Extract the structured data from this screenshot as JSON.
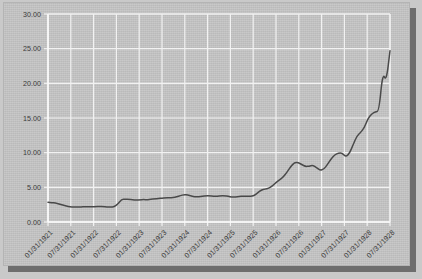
{
  "panel": {
    "background_color": "#c4c4c4",
    "shadow_color": "#6e6e6e",
    "grid_color": "#f2f2f2",
    "line_color": "#4a4a4a"
  },
  "chart_data": {
    "type": "line",
    "title": "",
    "subtitle": "",
    "xlabel": "",
    "ylabel": "",
    "ylim": [
      0.0,
      30.0
    ],
    "ytick_labels": [
      "0.00",
      "5.00",
      "10.00",
      "15.00",
      "20.00",
      "25.00",
      "30.00"
    ],
    "ytick_values": [
      0,
      5,
      10,
      15,
      20,
      25,
      30
    ],
    "grid": true,
    "legend": "none",
    "xtick_labels": [
      "01/31/1921",
      "07/31/1921",
      "01/31/1922",
      "07/31/1922",
      "01/31/1923",
      "07/31/1923",
      "01/31/1924",
      "07/31/1924",
      "01/31/1925",
      "07/31/1925",
      "01/31/1926",
      "07/31/1926",
      "01/31/1927",
      "07/31/1927",
      "01/31/1928",
      "07/31/1928"
    ],
    "xtick_rotation_degrees": -45,
    "series": [
      {
        "name": "index",
        "x": [
          "01/31/1921",
          "02/28/1921",
          "03/31/1921",
          "04/30/1921",
          "05/31/1921",
          "06/30/1921",
          "07/31/1921",
          "08/31/1921",
          "09/30/1921",
          "10/31/1921",
          "11/30/1921",
          "12/31/1921",
          "01/31/1922",
          "02/28/1922",
          "03/31/1922",
          "04/30/1922",
          "05/31/1922",
          "06/30/1922",
          "07/31/1922",
          "08/31/1922",
          "09/30/1922",
          "10/31/1922",
          "11/30/1922",
          "12/31/1922",
          "01/31/1923",
          "02/28/1923",
          "03/31/1923",
          "04/30/1923",
          "05/31/1923",
          "06/30/1923",
          "07/31/1923",
          "08/31/1923",
          "09/30/1923",
          "10/31/1923",
          "11/30/1923",
          "12/31/1923",
          "01/31/1924",
          "02/29/1924",
          "03/31/1924",
          "04/30/1924",
          "05/31/1924",
          "06/30/1924",
          "07/31/1924",
          "08/31/1924",
          "09/30/1924",
          "10/31/1924",
          "11/30/1924",
          "12/31/1924",
          "01/31/1925",
          "02/28/1925",
          "03/31/1925",
          "04/30/1925",
          "05/31/1925",
          "06/30/1925",
          "07/31/1925",
          "08/31/1925",
          "09/30/1925",
          "10/31/1925",
          "11/30/1925",
          "12/31/1925",
          "01/31/1926",
          "02/28/1926",
          "03/31/1926",
          "04/30/1926",
          "05/31/1926",
          "06/30/1926",
          "07/31/1926",
          "08/31/1926",
          "09/30/1926",
          "10/31/1926",
          "11/30/1926",
          "12/31/1926",
          "01/31/1927",
          "02/28/1927",
          "03/31/1927",
          "04/30/1927",
          "05/31/1927",
          "06/30/1927",
          "07/31/1927",
          "08/31/1927",
          "09/30/1927",
          "10/31/1927",
          "11/30/1927",
          "12/31/1927",
          "01/31/1928",
          "02/29/1928",
          "03/31/1928",
          "04/30/1928",
          "05/31/1928",
          "06/30/1928",
          "07/31/1928",
          "08/31/1928",
          "09/30/1928",
          "10/31/1928"
        ],
        "values": [
          2.85,
          2.8,
          2.72,
          2.6,
          2.45,
          2.3,
          2.18,
          2.15,
          2.15,
          2.18,
          2.22,
          2.2,
          2.2,
          2.22,
          2.25,
          2.22,
          2.18,
          2.15,
          2.2,
          2.6,
          3.25,
          3.3,
          3.28,
          3.22,
          3.15,
          3.2,
          3.25,
          3.2,
          3.3,
          3.35,
          3.38,
          3.45,
          3.48,
          3.5,
          3.52,
          3.62,
          3.8,
          3.95,
          3.9,
          3.72,
          3.62,
          3.65,
          3.7,
          3.78,
          3.78,
          3.72,
          3.7,
          3.8,
          3.8,
          3.72,
          3.58,
          3.6,
          3.68,
          3.72,
          3.72,
          3.7,
          3.78,
          4.2,
          4.62,
          4.75,
          4.85,
          5.2,
          5.7,
          6.1,
          6.5,
          7.2,
          8.0,
          8.55,
          8.58,
          8.3,
          8.0,
          8.05,
          8.2,
          7.85,
          7.45,
          7.6,
          8.3,
          9.1,
          9.7,
          9.95,
          9.95,
          9.4,
          9.9,
          11.2,
          12.4,
          12.9,
          13.6,
          14.9,
          15.6,
          15.9,
          16.0,
          21.5,
          20.3,
          24.7
        ]
      }
    ],
    "annotations": [],
    "n_points": 94,
    "value_min": 2.15,
    "value_max": 24.7,
    "value_first": 2.85,
    "value_last": 23.4
  }
}
